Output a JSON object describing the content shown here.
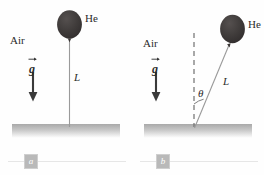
{
  "figure": {
    "background_color": "#fefefe",
    "ink_color": "#2b2b2b",
    "balloon_color": "#3d3a3a",
    "string_color": "#9a9a9a",
    "ground_color": "#b0b0b0",
    "panels": [
      {
        "id": "a",
        "caption_label": "a",
        "medium_label": "Air",
        "gas_label": "He",
        "length_label": "L",
        "gravity_label": "g",
        "angle_label": null,
        "string_angle_deg": 0,
        "has_dashed_reference": false
      },
      {
        "id": "b",
        "caption_label": "b",
        "medium_label": "Air",
        "gas_label": "He",
        "length_label": "L",
        "gravity_label": "g",
        "angle_label": "θ",
        "string_angle_deg": 22,
        "has_dashed_reference": true
      }
    ]
  }
}
